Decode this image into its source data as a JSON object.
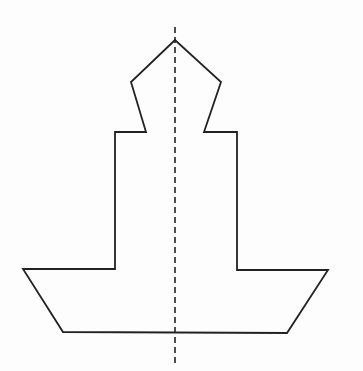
{
  "figure": {
    "colors": {
      "stroke": "#222222",
      "background": "#fdfdfd"
    },
    "shape_points": "175,40 131,82 146,132 115,132 115,269 23,269 63,332 287,333 328,270 237,270 237,132 204,132 221,82",
    "axis": {
      "x": 175,
      "y1": 27,
      "y2": 366,
      "dash": "6,4"
    }
  }
}
